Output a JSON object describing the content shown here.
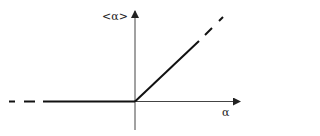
{
  "diagram": {
    "y_axis_label": "<α>",
    "x_axis_label": "α",
    "colors": {
      "line": "#111111",
      "axis": "#333333",
      "background": "#ffffff"
    },
    "segments": [
      {
        "name": "negative-branch",
        "description": "horizontal zero line for α < 0 (dashed extension to left)"
      },
      {
        "name": "positive-branch",
        "description": "linear increase for α > 0 (dashed extension to upper right)"
      }
    ]
  }
}
